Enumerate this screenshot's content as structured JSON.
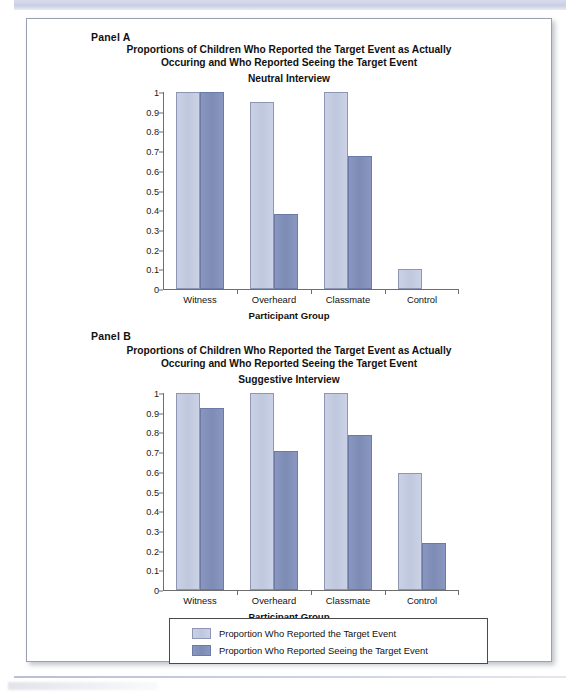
{
  "figure": {
    "panel_a_tag": "Panel A",
    "panel_b_tag": "Panel B",
    "title_line1": "Proportions of Children Who Reported the Target Event as Actually",
    "title_line2": "Occuring and Who Reported Seeing the Target Event",
    "x_axis_title": "Participant Group",
    "colors": {
      "light": "#c6cde1",
      "dark": "#818fba",
      "axis": "#6e6e6e"
    }
  },
  "legend": {
    "items": [
      {
        "swatch": "light",
        "label": "Proportion Who Reported the Target Event"
      },
      {
        "swatch": "dark",
        "label": "Proportion Who Reported Seeing the Target Event"
      }
    ]
  },
  "chart_data": [
    {
      "type": "bar",
      "panel": "Panel A",
      "title": "Proportions of Children Who Reported the Target Event as Actually Occuring and Who Reported Seeing the Target Event",
      "subtitle": "Neutral Interview",
      "xlabel": "Participant Group",
      "ylabel": "",
      "ylim": [
        0,
        1
      ],
      "yticks": [
        "0",
        "0.1",
        "0.2",
        "0.3",
        "0.4",
        "0.5",
        "0.6",
        "0.7",
        "0.8",
        "0.9",
        "1"
      ],
      "grid": false,
      "legend_position": "bottom",
      "categories": [
        "Witness",
        "Overheard",
        "Classmate",
        "Control"
      ],
      "series": [
        {
          "name": "Proportion Who Reported the Target Event",
          "color": "#c6cde1",
          "values": [
            1.0,
            0.95,
            1.0,
            0.1
          ]
        },
        {
          "name": "Proportion Who Reported Seeing the Target Event",
          "color": "#818fba",
          "values": [
            1.0,
            0.38,
            0.675,
            0.0
          ]
        }
      ]
    },
    {
      "type": "bar",
      "panel": "Panel B",
      "title": "Proportions of Children Who Reported the Target Event as Actually Occuring and Who Reported Seeing the Target Event",
      "subtitle": "Suggestive Interview",
      "xlabel": "Participant Group",
      "ylabel": "",
      "ylim": [
        0,
        1
      ],
      "yticks": [
        "0",
        "0.1",
        "0.2",
        "0.3",
        "0.4",
        "0.5",
        "0.6",
        "0.7",
        "0.8",
        "0.9",
        "1"
      ],
      "grid": false,
      "legend_position": "bottom",
      "categories": [
        "Witness",
        "Overheard",
        "Classmate",
        "Control"
      ],
      "series": [
        {
          "name": "Proportion Who Reported the Target Event",
          "color": "#c6cde1",
          "values": [
            1.0,
            1.0,
            1.0,
            0.595
          ]
        },
        {
          "name": "Proportion Who Reported Seeing the Target Event",
          "color": "#818fba",
          "values": [
            0.925,
            0.705,
            0.785,
            0.24
          ]
        }
      ]
    }
  ]
}
